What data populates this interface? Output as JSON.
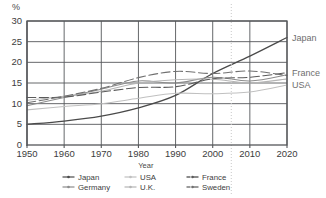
{
  "chart_data": {
    "type": "line",
    "title": "",
    "xlabel": "Year",
    "ylabel": "%",
    "xlim": [
      1950,
      2020
    ],
    "ylim": [
      0,
      30
    ],
    "grid": true,
    "x": [
      1950,
      1960,
      1970,
      1980,
      1990,
      2000,
      2010,
      2020
    ],
    "xtick_labels": [
      "1950",
      "1960",
      "1970",
      "1980",
      "1990",
      "2000",
      "2010",
      "2020"
    ],
    "ytick_labels": [
      "0",
      "5",
      "10",
      "15",
      "20",
      "25",
      "30"
    ],
    "y_unit_label": "%",
    "legend_position": "bottom",
    "annotations": {
      "projection_divider_year": 2005,
      "projection_divider_style": "dotted vertical line"
    },
    "series": [
      {
        "name": "Japan",
        "color": "#4a4a4a",
        "style": "solid",
        "end_label": "Japan",
        "end_value": 26,
        "values": [
          5.0,
          5.8,
          7.0,
          9.0,
          12.0,
          17.3,
          21.5,
          26.0
        ]
      },
      {
        "name": "Germany",
        "color": "#8c8c8c",
        "style": "solid",
        "end_label": "",
        "end_value": 17,
        "values": [
          9.5,
          11.5,
          13.5,
          15.5,
          15.0,
          16.4,
          15.5,
          17.0
        ]
      },
      {
        "name": "USA",
        "color": "#c0c0c0",
        "style": "solid",
        "end_label": "USA",
        "end_value": 14.5,
        "values": [
          8.5,
          9.3,
          10.0,
          11.3,
          12.5,
          12.4,
          12.8,
          14.5
        ]
      },
      {
        "name": "U.K.",
        "color": "#b5b5b5",
        "style": "solid",
        "end_label": "",
        "end_value": 16,
        "values": [
          10.8,
          11.8,
          13.0,
          15.0,
          15.8,
          15.9,
          15.0,
          16.0
        ]
      },
      {
        "name": "France",
        "color": "#5a5a5a",
        "style": "dashed",
        "end_label": "France",
        "end_value": 17.5,
        "values": [
          11.5,
          11.6,
          12.8,
          13.9,
          14.1,
          16.0,
          16.4,
          17.5
        ]
      },
      {
        "name": "Sweden",
        "color": "#707070",
        "style": "dashed",
        "end_label": "",
        "end_value": 16.8,
        "values": [
          10.2,
          11.8,
          13.7,
          16.3,
          17.8,
          17.3,
          17.9,
          16.8
        ]
      }
    ]
  },
  "axis": {
    "y_unit": "%",
    "x_title": "Year",
    "yticks": [
      "30",
      "25",
      "20",
      "15",
      "10",
      "5",
      "0"
    ],
    "xticks": [
      "1950",
      "1960",
      "1970",
      "1980",
      "1990",
      "2000",
      "2010",
      "2020"
    ]
  },
  "end_labels": {
    "japan": "Japan",
    "france": "France",
    "usa": "USA"
  },
  "legend": {
    "col1": [
      {
        "label": "Japan",
        "color": "#4a4a4a",
        "style": "solid"
      },
      {
        "label": "Germany",
        "color": "#8c8c8c",
        "style": "solid"
      }
    ],
    "col2": [
      {
        "label": "USA",
        "color": "#c0c0c0",
        "style": "solid"
      },
      {
        "label": "U.K.",
        "color": "#b5b5b5",
        "style": "solid"
      }
    ],
    "col3": [
      {
        "label": "France",
        "color": "#5a5a5a",
        "style": "dashed"
      },
      {
        "label": "Sweden",
        "color": "#707070",
        "style": "dashed"
      }
    ]
  }
}
